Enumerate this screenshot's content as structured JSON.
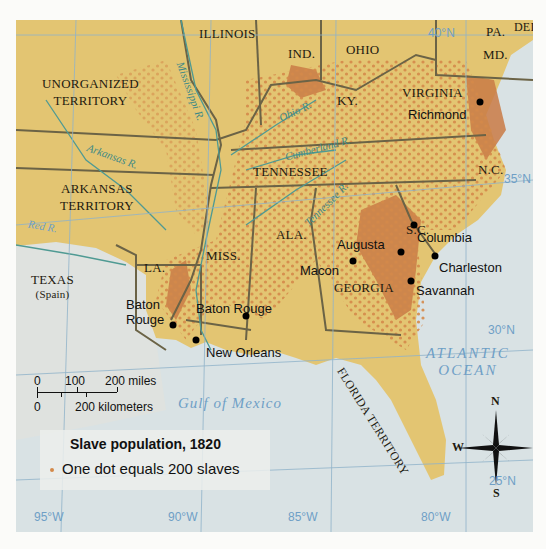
{
  "map": {
    "title": "Slave population, 1820",
    "legend": {
      "title": "Slave population, 1820",
      "dot_description": "One dot equals 200 slaves",
      "dot_color": "#d4894a"
    },
    "colors": {
      "land": "#e3c572",
      "dense": "#c97a45",
      "water": "#d9e2e4",
      "foreign_land": "#dfe2df",
      "border": "#6b6346",
      "river": "#4f9a93",
      "grid": "#8fb3c9"
    },
    "states": [
      {
        "name": "ILLINOIS"
      },
      {
        "name": "IND."
      },
      {
        "name": "OHIO"
      },
      {
        "name": "PA."
      },
      {
        "name": "DEL."
      },
      {
        "name": "MD."
      },
      {
        "name": "UNORGANIZED TERRITORY"
      },
      {
        "name": "KY."
      },
      {
        "name": "VIRGINIA"
      },
      {
        "name": "TENNESSEE"
      },
      {
        "name": "N.C."
      },
      {
        "name": "ARKANSAS TERRITORY"
      },
      {
        "name": "S.C."
      },
      {
        "name": "ALA."
      },
      {
        "name": "MISS."
      },
      {
        "name": "LA."
      },
      {
        "name": "GEORGIA"
      },
      {
        "name": "TEXAS"
      },
      {
        "name": "FLORIDA TERRITORY"
      }
    ],
    "texas_note": "(Spain)",
    "unorganized_line1": "UNORGANIZED",
    "unorganized_line2": "TERRITORY",
    "arkansas_line1": "ARKANSAS",
    "arkansas_line2": "TERRITORY",
    "cities": [
      {
        "name": "Richmond"
      },
      {
        "name": "Augusta"
      },
      {
        "name": "Columbia"
      },
      {
        "name": "Macon"
      },
      {
        "name": "Charleston"
      },
      {
        "name": "Savannah"
      },
      {
        "name": "Baton Rouge"
      },
      {
        "name": "Mobile"
      },
      {
        "name": "New Orleans"
      }
    ],
    "baton_line1": "Baton",
    "baton_line2": "Rouge",
    "rivers": [
      {
        "name": "Mississippi R."
      },
      {
        "name": "Ohio R."
      },
      {
        "name": "Cumberland R."
      },
      {
        "name": "Tennessee R."
      },
      {
        "name": "Arkansas R."
      },
      {
        "name": "Red R."
      }
    ],
    "water_bodies": {
      "gulf": "Gulf of Mexico",
      "atlantic_line1": "ATLANTIC",
      "atlantic_line2": "OCEAN"
    },
    "latitudes": [
      "40°N",
      "35°N",
      "30°N",
      "25°N"
    ],
    "longitudes": [
      "95°W",
      "90°W",
      "85°W",
      "80°W"
    ],
    "scale": {
      "miles_labels": [
        "0",
        "100",
        "200 miles"
      ],
      "km_labels": [
        "0",
        "200 kilometers"
      ]
    },
    "compass": {
      "n": "N",
      "s": "S",
      "e": "E",
      "w": "W"
    }
  }
}
